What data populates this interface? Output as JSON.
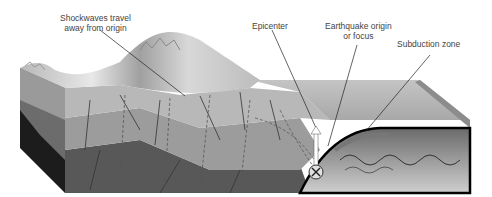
{
  "labels": {
    "shockwaves": {
      "line1": "Shockwaves travel",
      "line2": "away from origin"
    },
    "epicenter": "Epicenter",
    "origin": {
      "line1": "Earthquake origin",
      "line2": "or focus"
    },
    "subduction": "Subduction zone"
  },
  "colors": {
    "background": "#ffffff",
    "surface": "#c8c8c8",
    "layer_top": "#b4b4b4",
    "layer_mid": "#9a9a9a",
    "layer_deep": "#5a5a5a",
    "side_dark": "#1e1e1e",
    "text": "#444444"
  }
}
